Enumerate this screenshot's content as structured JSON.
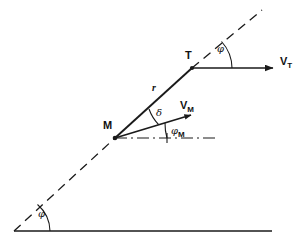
{
  "figure": {
    "kind": "vector-geometry-diagram",
    "width": 304,
    "height": 245,
    "background_color": "#ffffff",
    "stroke_color": "#1a1a1a"
  },
  "points": {
    "missile": {
      "label": "M",
      "x": 115,
      "y": 138
    },
    "target": {
      "label": "T",
      "x": 192,
      "y": 68
    },
    "los_lower_end": {
      "x": 14,
      "y": 231
    },
    "los_upper_end": {
      "x": 262,
      "y": 10
    },
    "ground_left": {
      "x": 14,
      "y": 231
    },
    "ground_right": {
      "x": 272,
      "y": 231
    }
  },
  "segments": {
    "range_label": "r",
    "los_style": "dashed-solid-dashed",
    "ground_style": "solid",
    "reference_style": "dash-dot"
  },
  "vectors": [
    {
      "name": "target-velocity",
      "label_base": "V",
      "label_sub": "T",
      "from_x": 192,
      "from_y": 68,
      "to_x": 278,
      "to_y": 68
    },
    {
      "name": "missile-velocity",
      "label_base": "V",
      "label_sub": "M",
      "from_x": 115,
      "from_y": 138,
      "to_x": 196,
      "to_y": 114
    }
  ],
  "angles": [
    {
      "name": "line-of-sight-angle-ground",
      "label_base": "φ",
      "label_sub": "",
      "vertex_x": 14,
      "vertex_y": 231,
      "label_x": 39,
      "label_y": 211
    },
    {
      "name": "line-of-sight-angle-target",
      "label_base": "φ",
      "label_sub": "",
      "vertex_x": 192,
      "vertex_y": 68,
      "label_x": 218,
      "label_y": 47
    },
    {
      "name": "lead-angle-delta",
      "label_base": "δ",
      "label_sub": "",
      "vertex_x": 115,
      "vertex_y": 138,
      "label_x": 156,
      "label_y": 111
    },
    {
      "name": "missile-heading-angle",
      "label_base": "φ",
      "label_sub": "M",
      "vertex_x": 115,
      "vertex_y": 138,
      "label_x": 172,
      "label_y": 130
    }
  ],
  "labels": {
    "missile_point": "M",
    "target_point": "T",
    "range": "r",
    "target_velocity_base": "V",
    "target_velocity_sub": "T",
    "missile_velocity_base": "V",
    "missile_velocity_sub": "M",
    "phi_los": "φ",
    "phi_target": "φ",
    "delta": "δ",
    "phi_missile_base": "φ",
    "phi_missile_sub": "M"
  }
}
